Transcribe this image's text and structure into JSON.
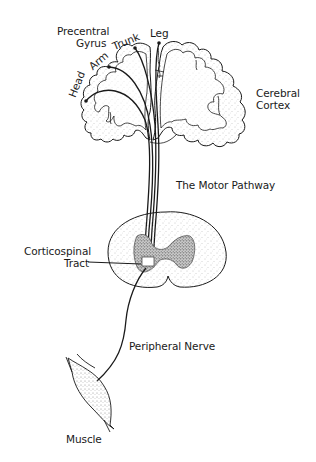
{
  "diagram": {
    "title": "The Motor Pathway",
    "labels": {
      "precentral_gyrus_line1": "Precentral",
      "precentral_gyrus_line2": "Gyrus",
      "head": "Head",
      "arm": "Arm",
      "trunk": "Trunk",
      "leg": "Leg",
      "cerebral_cortex_line1": "Cerebral",
      "cerebral_cortex_line2": "Cortex",
      "motor_pathway": "The Motor Pathway",
      "corticospinal_tract_line1": "Corticospinal",
      "corticospinal_tract_line2": "Tract",
      "peripheral_nerve": "Peripheral Nerve",
      "muscle": "Muscle"
    },
    "components": [
      "cerebral cortex (coronal section)",
      "precentral gyrus",
      "motor fibers: head, arm, trunk, leg",
      "spinal cord cross-section",
      "corticospinal tract",
      "peripheral nerve",
      "muscle"
    ],
    "colors": {
      "ink": "#1a1a1a",
      "stipple": "#9a9a9a",
      "background": "#ffffff"
    }
  }
}
